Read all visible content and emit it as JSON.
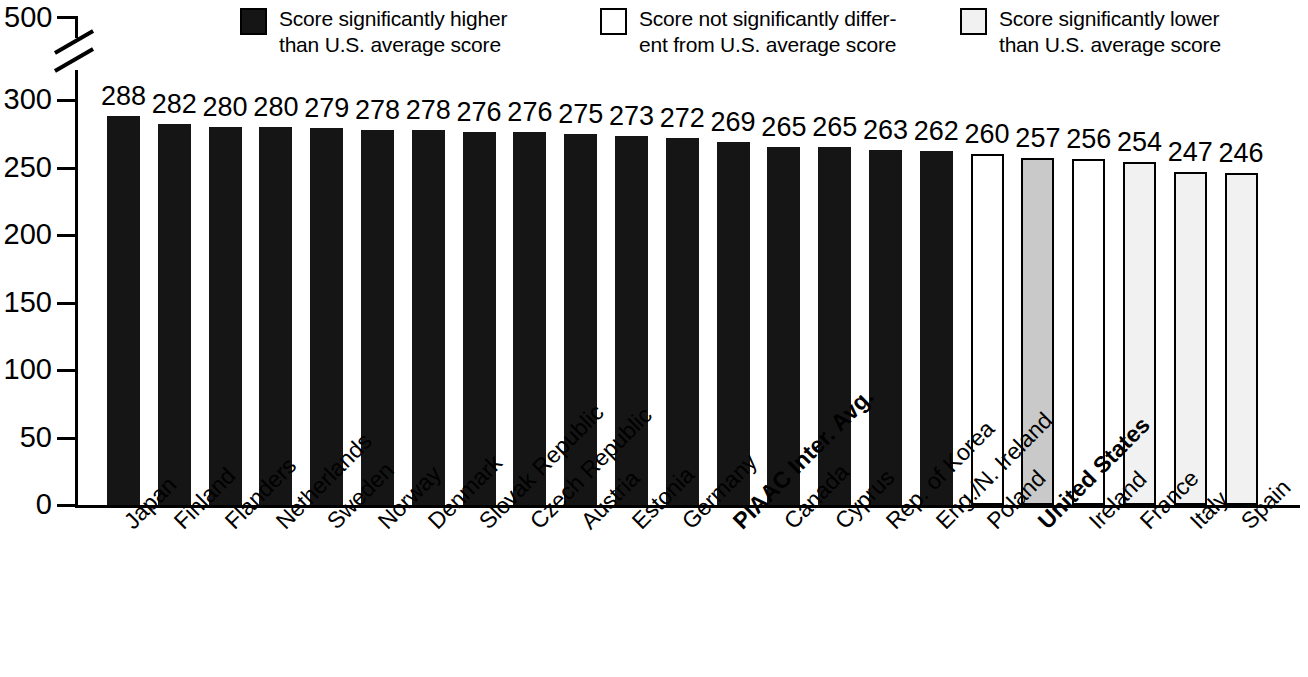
{
  "legend": {
    "items": [
      {
        "swatch": "black-square",
        "color": "#151515",
        "text": "Score significantly higher\nthan U.S. average score"
      },
      {
        "swatch": "white-square",
        "color": "#ffffff",
        "text": "Score not significantly differ-\nent from U.S. average score"
      },
      {
        "swatch": "light-gray-square",
        "color": "#f1f1f1",
        "text": "Score significantly lower\nthan U.S. average score"
      }
    ]
  },
  "chart_data": {
    "type": "bar",
    "title": "",
    "subtitle": "",
    "xlabel": "",
    "ylabel": "",
    "ylim": [
      0,
      300
    ],
    "axis_break": true,
    "axis_break_top_label": "500",
    "grid": false,
    "legend_position": "top",
    "ytick_labels": [
      "0",
      "50",
      "100",
      "150",
      "200",
      "250",
      "300"
    ],
    "ytick_values": [
      0,
      50,
      100,
      150,
      200,
      250,
      300
    ],
    "categories": [
      "Japan",
      "Finland",
      "Flanders",
      "Netherlands",
      "Sweden",
      "Norway",
      "Denmark",
      "Slovak Republic",
      "Czech Republic",
      "Austria",
      "Estonia",
      "Germany",
      "PIAAC Inter. Avg.",
      "Canada",
      "Cyprus",
      "Rep. of Korea",
      "Eng./N. Ireland",
      "Poland",
      "United States",
      "Ireland",
      "France",
      "Italy",
      "Spain"
    ],
    "values": [
      288,
      282,
      280,
      280,
      279,
      278,
      278,
      276,
      276,
      275,
      273,
      272,
      269,
      265,
      265,
      263,
      262,
      260,
      257,
      256,
      254,
      247,
      246
    ],
    "groups": [
      "higher",
      "higher",
      "higher",
      "higher",
      "higher",
      "higher",
      "higher",
      "higher",
      "higher",
      "higher",
      "higher",
      "higher",
      "higher",
      "higher",
      "higher",
      "higher",
      "higher",
      "same",
      "us",
      "same",
      "lower",
      "lower",
      "lower"
    ],
    "bold_categories": [
      "PIAAC Inter. Avg.",
      "United States"
    ]
  }
}
